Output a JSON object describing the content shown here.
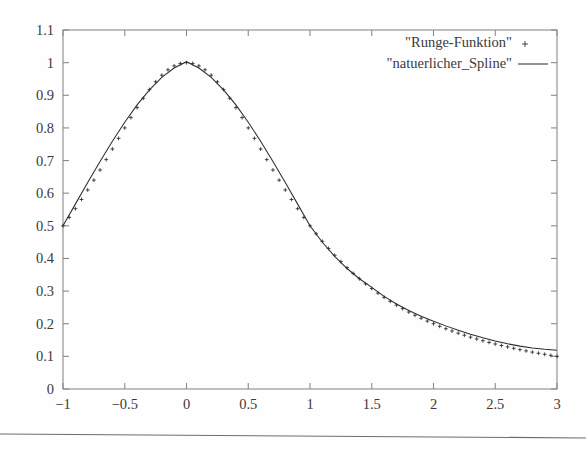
{
  "chart_data": {
    "type": "line",
    "title": "",
    "xlabel": "",
    "ylabel": "",
    "xlim": [
      -1,
      3
    ],
    "ylim": [
      0,
      1.1
    ],
    "grid": false,
    "legend_position": "top-right",
    "xticks": [
      -1,
      -0.5,
      0,
      0.5,
      1,
      1.5,
      2,
      2.5,
      3
    ],
    "xtick_labels": [
      "−1",
      "−0.5",
      "0",
      "0.5",
      "1",
      "1.5",
      "2",
      "2.5",
      "3"
    ],
    "yticks": [
      0,
      0.1,
      0.2,
      0.3,
      0.4,
      0.5,
      0.6,
      0.7,
      0.8,
      0.9,
      1,
      1.1
    ],
    "ytick_labels": [
      "0",
      "0.1",
      "0.2",
      "0.3",
      "0.4",
      "0.5",
      "0.6",
      "0.7",
      "0.8",
      "0.9",
      "1",
      "1.1"
    ],
    "series": [
      {
        "name": "\"Runge-Funktion\"",
        "style": "points",
        "marker": "+",
        "color": "#2b2b2b",
        "formula": "1/(1+x^2)",
        "x": [
          -1,
          -0.95,
          -0.9,
          -0.85,
          -0.8,
          -0.75,
          -0.7,
          -0.65,
          -0.6,
          -0.55,
          -0.5,
          -0.45,
          -0.4,
          -0.35,
          -0.3,
          -0.25,
          -0.2,
          -0.15,
          -0.1,
          -0.05,
          0,
          0.05,
          0.1,
          0.15,
          0.2,
          0.25,
          0.3,
          0.35,
          0.4,
          0.45,
          0.5,
          0.55,
          0.6,
          0.65,
          0.7,
          0.75,
          0.8,
          0.85,
          0.9,
          0.95,
          1,
          1.05,
          1.1,
          1.15,
          1.2,
          1.25,
          1.3,
          1.35,
          1.4,
          1.45,
          1.5,
          1.55,
          1.6,
          1.65,
          1.7,
          1.75,
          1.8,
          1.85,
          1.9,
          1.95,
          2,
          2.05,
          2.1,
          2.15,
          2.2,
          2.25,
          2.3,
          2.35,
          2.4,
          2.45,
          2.5,
          2.55,
          2.6,
          2.65,
          2.7,
          2.75,
          2.8,
          2.85,
          2.9,
          2.95,
          3
        ],
        "values": [
          0.5,
          0.5256,
          0.5525,
          0.5806,
          0.6098,
          0.64,
          0.6711,
          0.7029,
          0.7353,
          0.768,
          0.8,
          0.8316,
          0.8621,
          0.8909,
          0.9174,
          0.9412,
          0.9615,
          0.978,
          0.9901,
          0.9975,
          1,
          0.9975,
          0.9901,
          0.978,
          0.9615,
          0.9412,
          0.9174,
          0.8909,
          0.8621,
          0.8316,
          0.8,
          0.768,
          0.7353,
          0.7029,
          0.6711,
          0.64,
          0.6098,
          0.5806,
          0.5525,
          0.5256,
          0.5,
          0.4756,
          0.4525,
          0.4306,
          0.4098,
          0.3902,
          0.3717,
          0.3542,
          0.3378,
          0.3222,
          0.3077,
          0.2938,
          0.2809,
          0.2686,
          0.2571,
          0.2462,
          0.2358,
          0.2261,
          0.2169,
          0.2082,
          0.2,
          0.1922,
          0.1848,
          0.1778,
          0.1712,
          0.1649,
          0.1589,
          0.1533,
          0.1479,
          0.1428,
          0.1379,
          0.1333,
          0.1289,
          0.1247,
          0.1206,
          0.1168,
          0.1131,
          0.1096,
          0.1063,
          0.1031,
          0.1
        ]
      },
      {
        "name": "\"natuerlicher_Spline\"",
        "style": "lines",
        "color": "#2e2e2e",
        "x": [
          -1,
          -0.9,
          -0.8,
          -0.7,
          -0.6,
          -0.5,
          -0.4,
          -0.3,
          -0.2,
          -0.1,
          0,
          0.1,
          0.2,
          0.3,
          0.4,
          0.5,
          0.6,
          0.7,
          0.8,
          0.9,
          1,
          1.1,
          1.2,
          1.3,
          1.4,
          1.5,
          1.6,
          1.7,
          1.8,
          1.9,
          2,
          2.1,
          2.2,
          2.3,
          2.4,
          2.5,
          2.6,
          2.7,
          2.8,
          2.9,
          3
        ],
        "values": [
          0.5,
          0.5665,
          0.6325,
          0.6972,
          0.7593,
          0.8175,
          0.8704,
          0.9166,
          0.9548,
          0.9836,
          1.003,
          0.9836,
          0.9548,
          0.9166,
          0.8704,
          0.8175,
          0.7593,
          0.6972,
          0.6325,
          0.5665,
          0.5,
          0.4497,
          0.4063,
          0.3692,
          0.3378,
          0.3115,
          0.2838,
          0.2605,
          0.2406,
          0.2232,
          0.2076,
          0.1934,
          0.1803,
          0.1681,
          0.157,
          0.1471,
          0.1385,
          0.1314,
          0.1257,
          0.1215,
          0.1187
        ]
      }
    ]
  },
  "legend": {
    "entries": [
      {
        "label": "\"Runge-Funktion\"",
        "marker": "plus-marker"
      },
      {
        "label": "\"natuerlicher_Spline\"",
        "marker": "line-sample"
      }
    ]
  },
  "colors": {
    "frame": "#8a8a8a",
    "text": "#3a3a3a",
    "curve": "#2e2e2e",
    "marker": "#2b2b2b",
    "background": "#fefefe",
    "page_rule": "#6e6e6e"
  }
}
